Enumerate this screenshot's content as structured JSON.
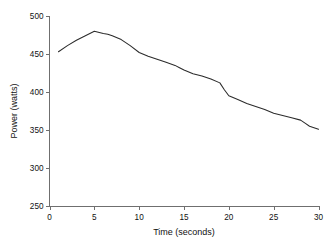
{
  "chart_data": {
    "type": "line",
    "title": "",
    "xlabel": "Time (seconds)",
    "ylabel": "Power (watts)",
    "xlim": [
      0,
      30
    ],
    "ylim": [
      250,
      500
    ],
    "xticks": [
      0,
      5,
      10,
      15,
      20,
      25,
      30
    ],
    "yticks": [
      250,
      300,
      350,
      400,
      450,
      500
    ],
    "xtick_labels": [
      "0",
      "5",
      "10",
      "15",
      "20",
      "25",
      "30"
    ],
    "ytick_labels": [
      "250",
      "300",
      "350",
      "400",
      "450",
      "500"
    ],
    "grid": false,
    "legend": null,
    "legend_position": "none",
    "line_color": "#2b2b2b",
    "background_color": "#ffffff",
    "axis_color": "#6f6f6f",
    "series": [
      {
        "name": "Power output",
        "x": [
          1,
          2,
          3,
          4,
          5,
          6,
          6.5,
          7,
          8,
          9,
          10,
          11,
          12,
          13,
          14,
          14.5,
          15,
          16,
          17,
          18,
          19,
          19.5,
          20,
          21,
          22,
          23,
          24,
          25,
          26,
          27,
          28,
          28.5,
          29,
          30
        ],
        "values": [
          453,
          461,
          468,
          474,
          480,
          477,
          476,
          474,
          469,
          461,
          452,
          447,
          443,
          439,
          435,
          432,
          429,
          424,
          421,
          417,
          412,
          403,
          395,
          390,
          385,
          381,
          377,
          372,
          369,
          366,
          363,
          359,
          355,
          351
        ]
      }
    ]
  },
  "axis_titles": {
    "x": "Time (seconds)",
    "y": "Power (watts)"
  }
}
